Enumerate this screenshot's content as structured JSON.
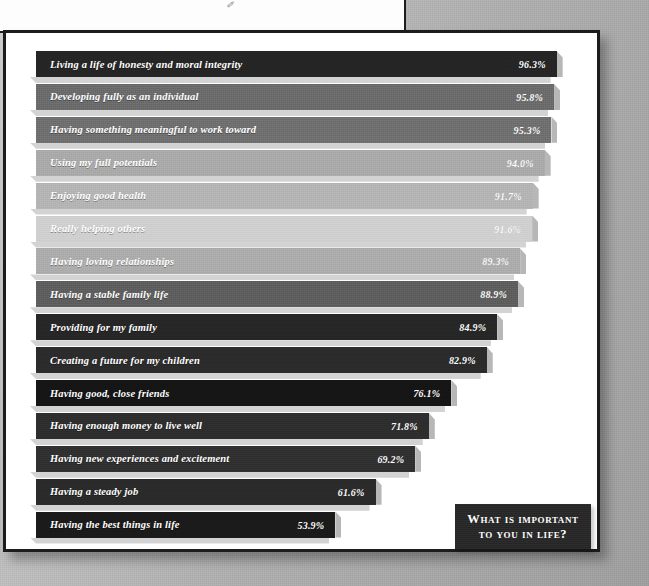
{
  "title": {
    "line1": "What is important",
    "line2": "to you in life?",
    "full": "What is important to you in life?"
  },
  "decor": {
    "corner_mark": "✐"
  },
  "chart_data": {
    "type": "bar",
    "orientation": "horizontal",
    "xlabel": "",
    "ylabel": "",
    "xlim": [
      0,
      100
    ],
    "grid": false,
    "legend": false,
    "value_suffix": "%",
    "categories": [
      "Living a life of honesty and moral integrity",
      "Developing fully as an individual",
      "Having something meaningful to work toward",
      "Using my full potentials",
      "Enjoying good health",
      "Really helping others",
      "Having loving relationships",
      "Having a stable family life",
      "Providing for my family",
      "Creating a future for my children",
      "Having good, close friends",
      "Having enough money to live well",
      "Having new experiences and excitement",
      "Having a steady job",
      "Having the best things in life"
    ],
    "values": [
      96.3,
      95.8,
      95.3,
      94.0,
      91.7,
      91.6,
      89.3,
      88.9,
      84.9,
      82.9,
      76.1,
      71.8,
      69.2,
      61.6,
      53.9
    ],
    "value_labels": [
      "96.3%",
      "95.8%",
      "95.3%",
      "94.0%",
      "91.7%",
      "91.6%",
      "89.3%",
      "88.9%",
      "84.9%",
      "82.9%",
      "76.1%",
      "71.8%",
      "69.2%",
      "61.6%",
      "53.9%"
    ],
    "bar_colors": [
      "#252525",
      "#6b6b6b",
      "#6f6f6f",
      "#a9a9a9",
      "#b4b4b4",
      "#cfcfcf",
      "#acacac",
      "#5d5d5d",
      "#262626",
      "#2b2b2b",
      "#151515",
      "#2e2e2e",
      "#303030",
      "#2a2a2a",
      "#1b1b1b"
    ]
  },
  "geometry": {
    "row_top_start": 18,
    "row_pitch": 32.9,
    "bar_left": 30,
    "scale_px_per_percent": 5.22,
    "bar_base_px": 18
  }
}
